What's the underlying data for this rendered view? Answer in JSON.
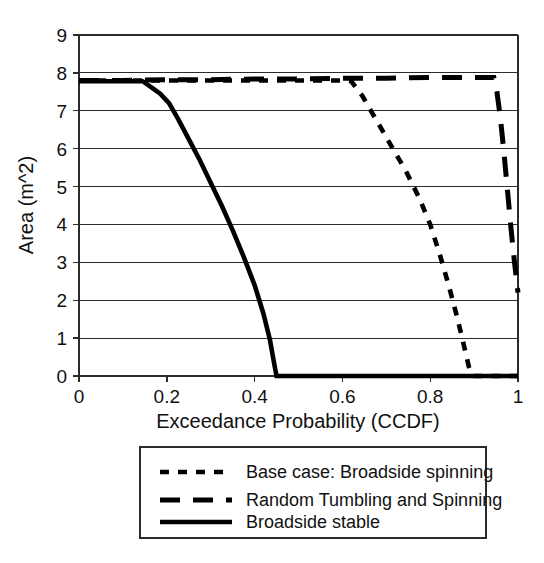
{
  "chart_data": {
    "type": "line",
    "title": "",
    "subtitle": "",
    "xlabel": "Exceedance Probability (CCDF)",
    "ylabel": "Area (m^2)",
    "xlim": [
      0,
      1
    ],
    "ylim": [
      0,
      9
    ],
    "xticks": [
      0,
      0.2,
      0.4,
      0.6,
      0.8,
      1
    ],
    "xticklabels": [
      "0",
      "0.2",
      "0.4",
      "0.6",
      "0.8",
      "1"
    ],
    "yticks": [
      0,
      1,
      2,
      3,
      4,
      5,
      6,
      7,
      8,
      9
    ],
    "yticklabels": [
      "0",
      "1",
      "2",
      "3",
      "4",
      "5",
      "6",
      "7",
      "8",
      "9"
    ],
    "grid": "horizontal",
    "legend_position": "below",
    "series": [
      {
        "name": "Base case: Broadside spinning",
        "style": "short-dash",
        "dasharray": "9 9",
        "width": 4.6,
        "color": "#000000",
        "x": [
          0.0,
          0.1,
          0.2,
          0.3,
          0.4,
          0.5,
          0.56,
          0.6,
          0.62,
          0.645,
          0.665,
          0.69,
          0.715,
          0.745,
          0.775,
          0.8,
          0.822,
          0.842,
          0.858,
          0.872,
          0.882,
          0.888,
          0.893,
          0.9,
          0.95,
          1.0
        ],
        "y": [
          7.8,
          7.8,
          7.8,
          7.8,
          7.8,
          7.8,
          7.8,
          7.8,
          7.78,
          7.4,
          7.0,
          6.5,
          6.0,
          5.4,
          4.7,
          4.0,
          3.2,
          2.4,
          1.7,
          1.05,
          0.55,
          0.25,
          0.08,
          0.0,
          0.0,
          0.0
        ]
      },
      {
        "name": "Random Tumbling and Spinning",
        "style": "long-dash",
        "dasharray": "20 13",
        "width": 5.0,
        "color": "#000000",
        "x": [
          0.0,
          0.1,
          0.2,
          0.3,
          0.4,
          0.5,
          0.6,
          0.7,
          0.8,
          0.88,
          0.92,
          0.945,
          0.952,
          0.96,
          0.968,
          0.976,
          0.984,
          0.992,
          1.0
        ],
        "y": [
          7.8,
          7.8,
          7.82,
          7.82,
          7.84,
          7.84,
          7.86,
          7.86,
          7.88,
          7.88,
          7.88,
          7.88,
          7.5,
          6.8,
          5.9,
          4.9,
          3.9,
          3.0,
          2.2
        ]
      },
      {
        "name": "Broadside stable",
        "style": "solid",
        "dasharray": "none",
        "width": 4.6,
        "color": "#000000",
        "x": [
          0.0,
          0.05,
          0.1,
          0.145,
          0.165,
          0.185,
          0.205,
          0.225,
          0.25,
          0.275,
          0.3,
          0.325,
          0.35,
          0.375,
          0.4,
          0.42,
          0.435,
          0.445,
          0.45,
          0.55,
          0.7,
          0.85,
          1.0
        ],
        "y": [
          7.78,
          7.78,
          7.78,
          7.78,
          7.62,
          7.45,
          7.2,
          6.8,
          6.25,
          5.7,
          5.1,
          4.5,
          3.85,
          3.15,
          2.4,
          1.65,
          0.95,
          0.3,
          0.0,
          0.0,
          0.0,
          0.0,
          0.0
        ]
      }
    ]
  },
  "legend": {
    "items": [
      {
        "label": "Base case: Broadside spinning",
        "style": "short-dash"
      },
      {
        "label": "Random Tumbling and Spinning",
        "style": "long-dash"
      },
      {
        "label": "Broadside stable",
        "style": "solid"
      }
    ]
  },
  "axes": {
    "x_title": "Exceedance Probability (CCDF)",
    "y_title": "Area (m^2)"
  },
  "colors": {
    "ink": "#000000",
    "grid": "#2b2b2b",
    "background": "#ffffff"
  }
}
